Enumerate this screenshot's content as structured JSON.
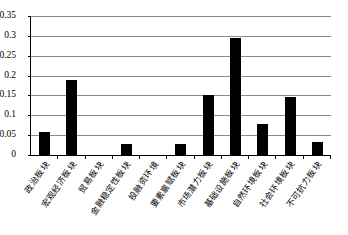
{
  "chart_data": {
    "type": "bar",
    "title": "",
    "xlabel": "",
    "ylabel": "",
    "ylim": [
      0,
      0.35
    ],
    "grid": true,
    "legend": "none",
    "series_color": "#000000",
    "yticks": [
      "0",
      "0.05",
      "0.1",
      "0.15",
      "0.2",
      "0.25",
      "0.3",
      "0.35"
    ],
    "ytick_values": [
      0,
      0.05,
      0.1,
      0.15,
      0.2,
      0.25,
      0.3,
      0.35
    ],
    "categories": [
      "政治板块",
      "宏观经济板块",
      "贸易板块",
      "金融稳定性板块",
      "投融资环境",
      "要素禀赋板块",
      "市场潜力板块",
      "基础设施板块",
      "自然环境板块",
      "社会环境板块",
      "不可抗力板块"
    ],
    "values": [
      0.057,
      0.19,
      0,
      0.027,
      0,
      0.027,
      0.152,
      0.295,
      0.077,
      0.145,
      0.033
    ]
  }
}
